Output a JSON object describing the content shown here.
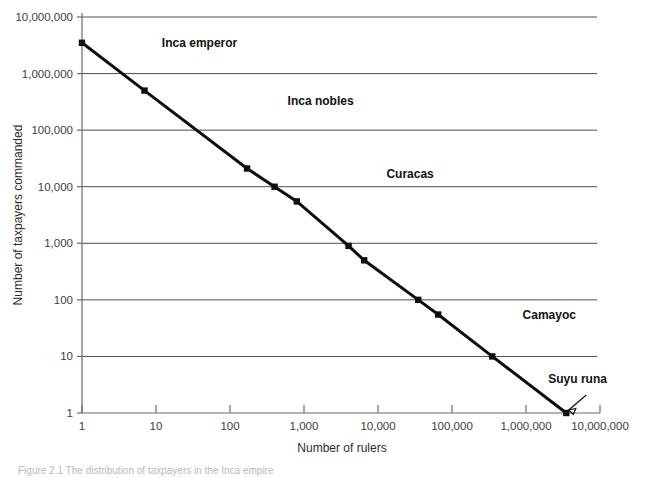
{
  "chart_data": {
    "type": "line",
    "title": "",
    "xlabel": "Number of rulers",
    "ylabel": "Number of taxpayers commanded",
    "xscale": "log",
    "yscale": "log",
    "xlim": [
      1,
      10000000
    ],
    "ylim": [
      1,
      10000000
    ],
    "grid": "horizontal",
    "legend": "none",
    "x_ticks": [
      "1",
      "10",
      "100",
      "1,000",
      "10,000",
      "100,000",
      "1,000,000",
      "10,000,000"
    ],
    "x_tick_values": [
      1,
      10,
      100,
      1000,
      10000,
      100000,
      1000000,
      10000000
    ],
    "y_ticks": [
      "1",
      "10",
      "100",
      "1,000",
      "10,000",
      "100,000",
      "1,000,000",
      "10,000,000"
    ],
    "y_tick_values": [
      1,
      10,
      100,
      1000,
      10000,
      100000,
      1000000,
      10000000
    ],
    "series": [
      {
        "name": "Inca administrative hierarchy",
        "x": [
          1,
          7,
          170,
          400,
          800,
          4000,
          6500,
          35000,
          65000,
          350000,
          3500000
        ],
        "y": [
          3500000,
          500000,
          21000,
          10000,
          5500,
          900,
          500,
          100,
          55,
          10,
          1
        ],
        "point_labels": [
          "",
          "Suyu",
          "Province",
          "Hunu",
          "Piska waranqa",
          "Waranqa",
          "Piska pachaka",
          "Pachaka",
          "Piska chunka",
          "Chunka",
          "Household"
        ]
      }
    ],
    "annotations": [
      {
        "text": "Inca emperor",
        "style": "bold",
        "x": 12,
        "y": 3500000
      },
      {
        "text": "Inca nobles",
        "style": "bold",
        "x": 600,
        "y": 330000
      },
      {
        "text": "Curacas",
        "style": "bold",
        "x": 13000,
        "y": 17000
      },
      {
        "text": "Camayoc",
        "style": "bold",
        "x": 900000,
        "y": 55
      },
      {
        "text": "Suyu runa",
        "style": "bold",
        "x": 2000000,
        "y": 4
      }
    ],
    "point_label_anchors": [
      "none",
      "end",
      "end",
      "start",
      "end",
      "end",
      "end",
      "start",
      "end",
      "end",
      "leader"
    ]
  },
  "figure": {
    "caption": "Figure 2.1 The distribution of taxpayers in the Inca empire"
  }
}
